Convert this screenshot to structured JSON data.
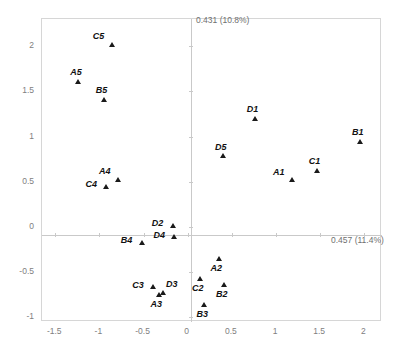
{
  "chart_data": {
    "type": "scatter",
    "title": "",
    "xlabel": "0.457 (11.4%)",
    "ylabel": "0.431 (10.8%)",
    "xlim": [
      -1.65,
      2.2
    ],
    "ylim": [
      -1.05,
      2.3
    ],
    "grid": false,
    "legend": "none",
    "xticks": [
      "-1.5",
      "-1",
      "-0.5",
      "0",
      "0.5",
      "1",
      "1.5",
      "2"
    ],
    "xtick_values": [
      -1.5,
      -1,
      -0.5,
      0,
      0.5,
      1,
      1.5,
      2
    ],
    "yticks": [
      "2",
      "1.5",
      "1",
      "0.5",
      "0",
      "-0.5",
      "-1"
    ],
    "ytick_values": [
      2,
      1.5,
      1,
      0.5,
      0,
      -0.5,
      -1
    ],
    "marker": "triangle",
    "marker_color": "#1a1a1a",
    "points": [
      {
        "label": "C5",
        "x": -0.86,
        "y": 2.02,
        "lab": "lab-al"
      },
      {
        "label": "A5",
        "x": -1.24,
        "y": 1.61,
        "lab": "lab-above"
      },
      {
        "label": "B5",
        "x": -0.95,
        "y": 1.41,
        "lab": "lab-above"
      },
      {
        "label": "D1",
        "x": 0.76,
        "y": 1.2,
        "lab": "lab-above"
      },
      {
        "label": "B1",
        "x": 1.95,
        "y": 0.95,
        "lab": "lab-above"
      },
      {
        "label": "D5",
        "x": 0.4,
        "y": 0.79,
        "lab": "lab-above"
      },
      {
        "label": "C1",
        "x": 1.46,
        "y": 0.63,
        "lab": "lab-above"
      },
      {
        "label": "A1",
        "x": 1.18,
        "y": 0.52,
        "lab": "lab-al"
      },
      {
        "label": "A4",
        "x": -0.79,
        "y": 0.53,
        "lab": "lab-al"
      },
      {
        "label": "C4",
        "x": -0.92,
        "y": 0.45,
        "lab": "lab-left"
      },
      {
        "label": "D2",
        "x": -0.17,
        "y": 0.02,
        "lab": "lab-left"
      },
      {
        "label": "D4",
        "x": -0.15,
        "y": -0.11,
        "lab": "lab-left"
      },
      {
        "label": "B4",
        "x": -0.52,
        "y": -0.17,
        "lab": "lab-left"
      },
      {
        "label": "A2",
        "x": 0.35,
        "y": -0.35,
        "lab": "lab-below"
      },
      {
        "label": "C2",
        "x": 0.14,
        "y": -0.57,
        "lab": "lab-below"
      },
      {
        "label": "B2",
        "x": 0.41,
        "y": -0.64,
        "lab": "lab-below"
      },
      {
        "label": "C3",
        "x": -0.39,
        "y": -0.66,
        "lab": "lab-left"
      },
      {
        "label": "D3",
        "x": -0.28,
        "y": -0.72,
        "lab": "lab-ar"
      },
      {
        "label": "A3",
        "x": -0.33,
        "y": -0.75,
        "lab": "lab-below"
      },
      {
        "label": "B3",
        "x": 0.19,
        "y": -0.86,
        "lab": "lab-below"
      }
    ]
  },
  "axes": {
    "x_title": "0.457 (11.4%)",
    "y_title": "0.431 (10.8%)"
  }
}
